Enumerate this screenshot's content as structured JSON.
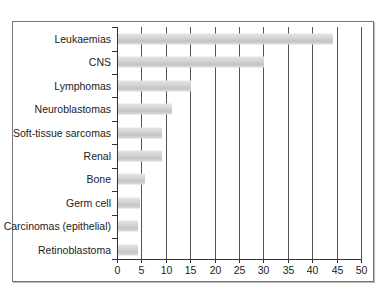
{
  "chart_data": {
    "type": "bar",
    "orientation": "horizontal",
    "title": "",
    "xlabel": "",
    "ylabel": "",
    "categories": [
      "Leukaemias",
      "CNS",
      "Lymphomas",
      "Neuroblastomas",
      "Soft-tissue sarcomas",
      "Renal",
      "Bone",
      "Germ cell",
      "Carcinomas (epithelial)",
      "Retinoblastoma"
    ],
    "values": [
      44,
      30,
      15,
      11,
      9,
      9,
      5.5,
      4.5,
      4,
      4
    ],
    "xlim": [
      0,
      50
    ],
    "xticks": [
      0,
      5,
      10,
      15,
      20,
      25,
      30,
      35,
      40,
      45,
      50
    ],
    "grid": "vertical",
    "legend": null,
    "bar_color": "#d0d0d0"
  },
  "axis": {
    "x_tick_labels": [
      "0",
      "5",
      "10",
      "15",
      "20",
      "25",
      "30",
      "35",
      "40",
      "45",
      "50"
    ]
  }
}
